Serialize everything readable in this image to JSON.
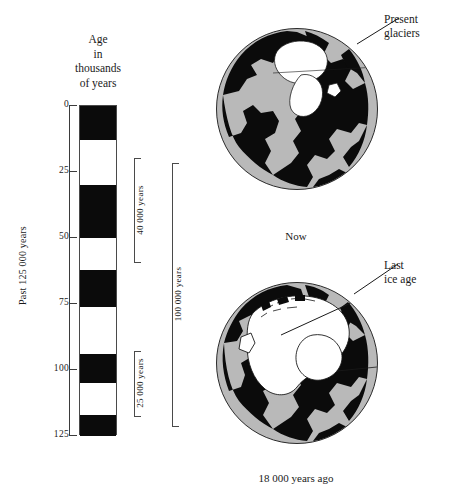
{
  "figure": {
    "title_lines": [
      "Age",
      "in",
      "thousands",
      "of",
      "years"
    ],
    "axis_title": "Past 125 000 years"
  },
  "column_header": {
    "line1": "Age",
    "line2": "in",
    "line3": "thousands",
    "line4": "of years"
  },
  "axis": {
    "label": "Past 125 000 years",
    "unit": "thousands of years",
    "min": 0,
    "max": 125,
    "ticks": [
      {
        "value": 0,
        "label": "0"
      },
      {
        "value": 25,
        "label": "25"
      },
      {
        "value": 50,
        "label": "50"
      },
      {
        "value": 75,
        "label": "75"
      },
      {
        "value": 100,
        "label": "100"
      },
      {
        "value": 125,
        "label": "125"
      }
    ]
  },
  "chart_data": {
    "type": "bar",
    "title": "Age in thousands of years",
    "xlabel": "",
    "ylabel": "Past 125 000 years",
    "ylim": [
      0,
      125
    ],
    "orientation": "vertical-stacked-bands",
    "legend": [
      {
        "key": "glacial",
        "label": "Glacial (black)",
        "color": "#0b0b0b"
      },
      {
        "key": "interglacial",
        "label": "Interglacial (white)",
        "color": "#ffffff"
      }
    ],
    "bands": [
      {
        "state": "glacial",
        "start": 0,
        "end": 13
      },
      {
        "state": "interglacial",
        "start": 13,
        "end": 30
      },
      {
        "state": "glacial",
        "start": 30,
        "end": 50
      },
      {
        "state": "interglacial",
        "start": 50,
        "end": 62
      },
      {
        "state": "glacial",
        "start": 62,
        "end": 76
      },
      {
        "state": "interglacial",
        "start": 76,
        "end": 94
      },
      {
        "state": "glacial",
        "start": 94,
        "end": 105
      },
      {
        "state": "interglacial",
        "start": 105,
        "end": 117
      },
      {
        "state": "glacial",
        "start": 117,
        "end": 125
      }
    ],
    "brackets": [
      {
        "id": "inner-40k",
        "label": "40 000 years",
        "start": 20,
        "end": 60,
        "column": 1
      },
      {
        "id": "inner-25k",
        "label": "25 000 years",
        "start": 93,
        "end": 118,
        "column": 1
      },
      {
        "id": "outer-100k",
        "label": "100 000 years",
        "start": 22,
        "end": 122,
        "column": 2
      }
    ]
  },
  "globes": [
    {
      "id": "globe-now",
      "caption": "Now",
      "callout": {
        "line1": "Present",
        "line2": "glaciers"
      },
      "ocean_color": "#b9b9b9",
      "land_color": "#0b0b0b",
      "ice_color": "#ffffff"
    },
    {
      "id": "globe-ice-age",
      "caption": "18 000 years ago",
      "callout": {
        "line1": "Last",
        "line2": "ice age"
      },
      "ocean_color": "#b9b9b9",
      "land_color": "#0b0b0b",
      "ice_color": "#ffffff"
    }
  ],
  "colors": {
    "glacial": "#0b0b0b",
    "interglacial": "#ffffff",
    "ocean": "#b9b9b9",
    "ink": "#1a1a1a",
    "rule": "#4a4a4a"
  }
}
